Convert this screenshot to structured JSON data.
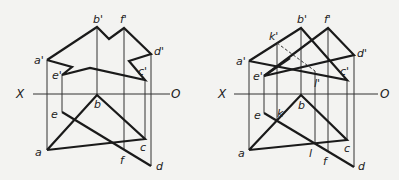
{
  "figures": [
    {
      "id": "left",
      "axis": {
        "left_label": "X",
        "right_label": "O"
      },
      "elevation_labels": [
        "a'",
        "b'",
        "f'",
        "d'",
        "e'",
        "c'"
      ],
      "plan_labels": [
        "a",
        "b",
        "c",
        "d",
        "e",
        "f"
      ]
    },
    {
      "id": "right",
      "axis": {
        "left_label": "X",
        "right_label": "O"
      },
      "elevation_labels": [
        "a'",
        "b'",
        "f'",
        "d'",
        "e'",
        "c'",
        "k'",
        "l'"
      ],
      "plan_labels": [
        "a",
        "b",
        "c",
        "d",
        "e",
        "f",
        "k",
        "l"
      ]
    }
  ]
}
